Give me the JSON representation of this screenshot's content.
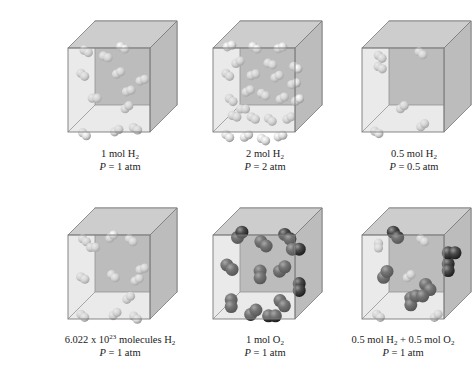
{
  "figure": {
    "colors": {
      "cube_face": "#c4c4c4",
      "cube_back": "#b8b8b8",
      "cube_edge": "#7a7a7a",
      "h2_atom_light": "#f2f2f2",
      "h2_atom_dark": "#a8a8a8",
      "o2_atom_light": "#8a8a8a",
      "o2_atom_dark": "#2e2e2e"
    },
    "panels": [
      {
        "id": "p1",
        "row": 0,
        "col": 0,
        "line1_prefix": "1 mol H",
        "line1_sub": "2",
        "line1_suffix": "",
        "line2_var": "P",
        "line2_rest": " = 1 atm",
        "species": "H2",
        "molecules": 12
      },
      {
        "id": "p2",
        "row": 0,
        "col": 1,
        "line1_prefix": "2 mol H",
        "line1_sub": "2",
        "line1_suffix": "",
        "line2_var": "P",
        "line2_rest": " = 2 atm",
        "species": "H2",
        "molecules": 24
      },
      {
        "id": "p3",
        "row": 0,
        "col": 2,
        "line1_prefix": "0.5 mol H",
        "line1_sub": "2",
        "line1_suffix": "",
        "line2_var": "P",
        "line2_rest": " = 0.5 atm",
        "species": "H2",
        "molecules": 6
      },
      {
        "id": "p4",
        "row": 1,
        "col": 0,
        "line1_prefix": "6.022  x 10",
        "line1_sup": "23",
        "line1_mid": " molecules H",
        "line1_sub": "2",
        "line2_var": "P",
        "line2_rest": " = 1 atm",
        "species": "H2",
        "molecules": 12
      },
      {
        "id": "p5",
        "row": 1,
        "col": 1,
        "line1_prefix": "1 mol O",
        "line1_sub": "2",
        "line1_suffix": "",
        "line2_var": "P",
        "line2_rest": " = 1 atm",
        "species": "O2",
        "molecules": 12
      },
      {
        "id": "p6",
        "row": 1,
        "col": 2,
        "line1_prefix": "0.5 mol H",
        "line1_sub": "2",
        "line1_mid": " + 0.5 mol O",
        "line1_sub2": "2",
        "line2_var": "P",
        "line2_rest": " = 1 atm",
        "species": "H2+O2",
        "molecules": 12
      }
    ]
  }
}
